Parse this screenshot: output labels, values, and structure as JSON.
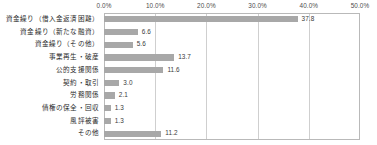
{
  "chart_data": {
    "type": "bar",
    "orientation": "horizontal",
    "title": "",
    "subtitle": "",
    "xlabel": "",
    "ylabel": "",
    "xlim": [
      0,
      50
    ],
    "grid": true,
    "legend": false,
    "legend_position": "none",
    "unit": "%",
    "bar_color": "#a8a8a8",
    "gridline_color": "#cfcfcf",
    "axis_color": "#b9b9b9",
    "xticks": [
      0,
      10,
      20,
      30,
      40,
      50
    ],
    "xtick_labels": [
      "0.0%",
      "10.0%",
      "20.0%",
      "30.0%",
      "40.0%",
      "50.0%"
    ],
    "categories": [
      "資金繰り（借入金返済困難）",
      "資金繰り（新たな融資）",
      "資金繰り（その他）",
      "事業再生・破産",
      "公的支援関係",
      "契約・取引",
      "労務関係",
      "債権の保全・回収",
      "風評被害",
      "その他"
    ],
    "values": [
      37.8,
      6.6,
      5.6,
      13.7,
      11.6,
      3.0,
      2.1,
      1.3,
      1.3,
      11.2
    ],
    "value_labels": [
      "37.8",
      "6.6",
      "5.6",
      "13.7",
      "11.6",
      "3.0",
      "2.1",
      "1.3",
      "1.3",
      "11.2"
    ]
  }
}
